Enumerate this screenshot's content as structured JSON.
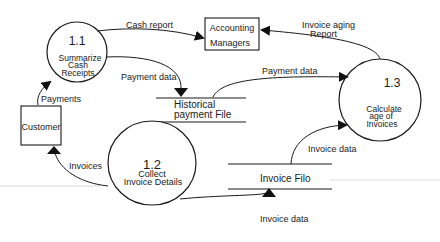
{
  "diagram": {
    "type": "data-flow-diagram",
    "processes": [
      {
        "id": "1.1",
        "number": "1.1",
        "lines": [
          "Summarize",
          "Cash",
          "Receipts"
        ]
      },
      {
        "id": "1.2",
        "number": "1.2",
        "lines": [
          "Collect",
          "Invoice Details"
        ]
      },
      {
        "id": "1.3",
        "number": "1.3",
        "lines": [
          "Calculate",
          "age of",
          "Invoices"
        ]
      }
    ],
    "entities": [
      {
        "id": "accounting-managers",
        "lines": [
          "Accounting",
          "Managers"
        ]
      },
      {
        "id": "customer",
        "lines": [
          "Customer"
        ]
      }
    ],
    "data_stores": [
      {
        "id": "historical-payment-file",
        "lines": [
          "Historical",
          "payment File"
        ]
      },
      {
        "id": "invoice-file",
        "lines": [
          "Invoice Filo"
        ]
      }
    ],
    "flows": [
      {
        "from": "1.1",
        "to": "accounting-managers",
        "label": "Cash report"
      },
      {
        "from": "1.3",
        "to": "accounting-managers",
        "label_lines": [
          "Invoice aging",
          "Report"
        ]
      },
      {
        "from": "1.1",
        "to": "historical-payment-file",
        "label": "Payment data"
      },
      {
        "from": "historical-payment-file",
        "to": "1.3",
        "label": "Payment data"
      },
      {
        "from": "customer",
        "to": "1.1",
        "label": "Payments"
      },
      {
        "from": "1.2",
        "to": "customer",
        "label": "Invoices"
      },
      {
        "from": "1.2",
        "to": "invoice-file",
        "label": "Invoice data"
      },
      {
        "from": "invoice-file",
        "to": "1.3",
        "label": "Invoice data"
      }
    ]
  }
}
